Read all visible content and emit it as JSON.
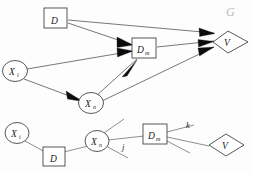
{
  "figure": {
    "graph_name": "G",
    "graph_name_display": "G",
    "background": "#fdfdfd",
    "ink_color": "#1a1a1a",
    "edge_color": "#555555",
    "arrow_color": "#0d0d0d",
    "graph_name_color": "#b9b9b9"
  },
  "upper_graph": {
    "name": "G",
    "nodes": [
      {
        "id": "D",
        "shape": "square",
        "label": "D",
        "subscript": "",
        "cx": 55,
        "cy": 18
      },
      {
        "id": "Dm",
        "shape": "square",
        "label": "D",
        "subscript": "m",
        "cx": 143,
        "cy": 48
      },
      {
        "id": "Xi",
        "shape": "circle",
        "label": "X",
        "subscript": "i",
        "cx": 15,
        "cy": 71
      },
      {
        "id": "Xn",
        "shape": "circle",
        "label": "X",
        "subscript": "n",
        "cx": 91,
        "cy": 103
      },
      {
        "id": "V",
        "shape": "diamond",
        "label": "V",
        "subscript": "",
        "cx": 227,
        "cy": 42
      }
    ],
    "edges": [
      {
        "from": "D",
        "to": "V",
        "directed": true
      },
      {
        "from": "D",
        "to": "Dm",
        "directed": true
      },
      {
        "from": "Xi",
        "to": "Dm",
        "directed": true
      },
      {
        "from": "Xi",
        "to": "Xn",
        "directed": true
      },
      {
        "from": "Xn",
        "to": "Dm",
        "directed": true
      },
      {
        "from": "Xn",
        "to": "V",
        "directed": true
      },
      {
        "from": "Dm",
        "to": "V",
        "directed": true
      }
    ]
  },
  "lower_graph": {
    "nodes": [
      {
        "id": "Xi2",
        "shape": "circle",
        "label": "X",
        "subscript": "i",
        "cx": 17,
        "cy": 133
      },
      {
        "id": "D2",
        "shape": "square",
        "label": "D",
        "subscript": "",
        "cx": 54,
        "cy": 157
      },
      {
        "id": "Xn2",
        "shape": "circle",
        "label": "X",
        "subscript": "n",
        "cx": 97,
        "cy": 141
      },
      {
        "id": "Dm2",
        "shape": "square",
        "label": "D",
        "subscript": "m",
        "cx": 155,
        "cy": 134
      },
      {
        "id": "V2",
        "shape": "diamond",
        "label": "V",
        "subscript": "",
        "cx": 224,
        "cy": 145
      }
    ],
    "edges": [
      {
        "from": "Xi2",
        "to": "D2",
        "directed": false,
        "label": ""
      },
      {
        "from": "D2",
        "to": "Xn2",
        "directed": false,
        "label": ""
      },
      {
        "from": "Xn2",
        "to": "Dm2",
        "directed": false,
        "label": "j"
      },
      {
        "from": "Dm2",
        "to": "V2",
        "directed": false,
        "label": "k"
      }
    ],
    "edge_labels": [
      {
        "text": "j",
        "x": 125,
        "y": 148
      },
      {
        "text": "k",
        "x": 188,
        "y": 131
      }
    ],
    "dangling_edges": [
      {
        "from": "Xn2",
        "direction": "up-right"
      },
      {
        "from": "Xn2",
        "direction": "down-right"
      },
      {
        "from": "Dm2",
        "direction": "up-right"
      },
      {
        "from": "Dm2",
        "direction": "down-right"
      }
    ]
  }
}
